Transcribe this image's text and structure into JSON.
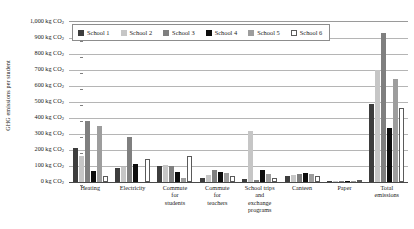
{
  "chart_data": {
    "type": "bar",
    "title": "",
    "xlabel": "",
    "ylabel": "GHG emissions per student",
    "ylim": [
      0,
      1000
    ],
    "grid": true,
    "legend_position": "top-left-inside",
    "unit": "kg CO2",
    "categories": [
      "Heating",
      "Electricity",
      "Commute for students",
      "Commute for teachers",
      "School trips and exchange programs",
      "Canteen",
      "Paper",
      "Total emissions"
    ],
    "category_labels": [
      [
        "Heating"
      ],
      [
        "Electricity"
      ],
      [
        "Commute",
        "for",
        "students"
      ],
      [
        "Commute",
        "for",
        "teachers"
      ],
      [
        "School trips",
        "and",
        "exchange",
        "programs"
      ],
      [
        "Canteen"
      ],
      [
        "Paper"
      ],
      [
        "Total",
        "emissions"
      ]
    ],
    "y_ticks": [
      0,
      100,
      200,
      300,
      400,
      500,
      600,
      700,
      800,
      900,
      1000
    ],
    "y_tick_labels": [
      "1,000 kg CO",
      "900 kg CO",
      "800 kg CO",
      "700 kg CO",
      "600 kg CO",
      "500 kg CO",
      "400 kg CO",
      "300 kg CO",
      "200 kg CO",
      "100 kg CO",
      "0 kg CO"
    ],
    "y_tick_subscript": "2",
    "series": [
      {
        "name": "School 1",
        "color": "#3d3d3d",
        "values": [
          215,
          90,
          100,
          25,
          20,
          40,
          5,
          490
        ]
      },
      {
        "name": "School 2",
        "color": "#c6c6c6",
        "values": [
          160,
          95,
          105,
          45,
          320,
          45,
          5,
          700
        ]
      },
      {
        "name": "School 3",
        "color": "#7f7f7f",
        "values": [
          380,
          280,
          100,
          75,
          15,
          50,
          5,
          930
        ]
      },
      {
        "name": "School 4",
        "color": "#0d0d0d",
        "values": [
          70,
          110,
          60,
          60,
          75,
          55,
          5,
          340
        ]
      },
      {
        "name": "School 5",
        "color": "#9d9d9d",
        "values": [
          350,
          0,
          25,
          55,
          50,
          50,
          5,
          645
        ]
      },
      {
        "name": "School 6",
        "color": "#ffffff",
        "values": [
          40,
          145,
          160,
          35,
          25,
          40,
          5,
          460
        ]
      }
    ]
  }
}
